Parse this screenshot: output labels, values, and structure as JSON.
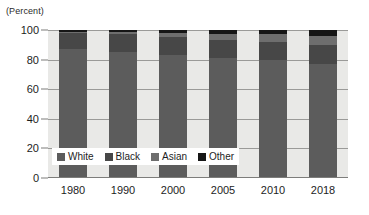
{
  "chart_data": {
    "type": "bar",
    "subtype": "stacked-percent",
    "title": "",
    "subtitle": "",
    "unit_caption": "(Percent)",
    "xlabel": "",
    "ylabel": "",
    "categories": [
      "1980",
      "1990",
      "2000",
      "2005",
      "2010",
      "2018"
    ],
    "ylim": [
      0,
      100
    ],
    "yticks": [
      0,
      20,
      40,
      60,
      80,
      100
    ],
    "ytick_labels": [
      "0",
      "20",
      "40",
      "60",
      "80",
      "100"
    ],
    "grid": true,
    "legend_position": "inside-lower-left",
    "series": [
      {
        "name": "White",
        "values": [
          87,
          85,
          83,
          81,
          80,
          77
        ]
      },
      {
        "name": "Black",
        "values": [
          11,
          12,
          12,
          12,
          12,
          13
        ]
      },
      {
        "name": "Asian",
        "values": [
          1,
          2,
          3,
          4,
          5,
          6
        ]
      },
      {
        "name": "Other",
        "values": [
          1,
          1,
          2,
          3,
          3,
          4
        ]
      }
    ],
    "colors": {
      "White": "#5c5c5c",
      "Black": "#474747",
      "Asian": "#6e6e6e",
      "Other": "#161616"
    },
    "plot_background": "#e9e9e7",
    "gridline_color": "#9a9a98"
  },
  "legend": {
    "items": [
      {
        "label": "White",
        "color": "#5c5c5c"
      },
      {
        "label": "Black",
        "color": "#474747"
      },
      {
        "label": "Asian",
        "color": "#6e6e6e"
      },
      {
        "label": "Other",
        "color": "#161616"
      }
    ]
  }
}
